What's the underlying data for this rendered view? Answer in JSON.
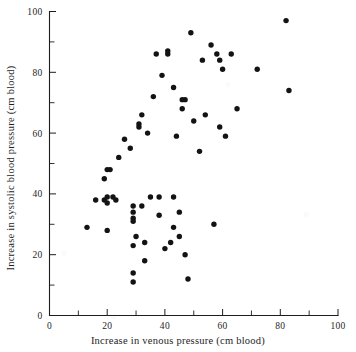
{
  "figure": {
    "background_color": "#ffffff",
    "ink_color": "#131313"
  },
  "chart_data": {
    "type": "scatter",
    "title": "",
    "subtitle": "",
    "xlabel": "Increase in venous pressure (cm blood)",
    "ylabel": "Increase in systolic blood pressure (cm blood)",
    "xlim": [
      0,
      100
    ],
    "ylim": [
      0,
      100
    ],
    "xticks": [
      0,
      20,
      40,
      60,
      80,
      100
    ],
    "yticks": [
      0,
      20,
      40,
      60,
      80,
      100
    ],
    "xticklabels": [
      "0",
      "20",
      "40",
      "60",
      "80",
      "100"
    ],
    "yticklabels": [
      "0",
      "20",
      "40",
      "60",
      "80",
      "100"
    ],
    "x_minor_tick_interval": 10,
    "y_minor_tick_interval": 10,
    "grid": false,
    "legend": null,
    "marker": "filled-circle",
    "marker_color": "#131313",
    "series": [
      {
        "name": "observations",
        "points": [
          [
            13,
            29
          ],
          [
            16,
            38
          ],
          [
            19,
            45
          ],
          [
            19,
            38
          ],
          [
            20,
            39
          ],
          [
            20,
            37
          ],
          [
            20,
            28
          ],
          [
            22,
            39
          ],
          [
            23,
            38
          ],
          [
            20,
            48
          ],
          [
            21,
            48
          ],
          [
            24,
            52
          ],
          [
            26,
            58
          ],
          [
            28,
            55
          ],
          [
            29,
            23
          ],
          [
            29,
            36
          ],
          [
            29,
            34
          ],
          [
            29,
            32
          ],
          [
            29,
            31
          ],
          [
            29,
            14
          ],
          [
            29,
            11
          ],
          [
            30,
            26
          ],
          [
            31,
            62
          ],
          [
            31,
            63
          ],
          [
            32,
            66
          ],
          [
            32,
            36
          ],
          [
            33,
            24
          ],
          [
            33,
            18
          ],
          [
            34,
            60
          ],
          [
            35,
            39
          ],
          [
            36,
            72
          ],
          [
            37,
            86
          ],
          [
            38,
            39
          ],
          [
            38,
            33
          ],
          [
            39,
            79
          ],
          [
            40,
            22
          ],
          [
            41,
            87
          ],
          [
            41,
            86
          ],
          [
            42,
            24
          ],
          [
            43,
            75
          ],
          [
            43,
            39
          ],
          [
            43,
            29
          ],
          [
            44,
            59
          ],
          [
            45,
            34
          ],
          [
            45,
            26
          ],
          [
            46,
            71
          ],
          [
            46,
            68
          ],
          [
            47,
            71
          ],
          [
            47,
            20
          ],
          [
            48,
            12
          ],
          [
            49,
            93
          ],
          [
            50,
            64
          ],
          [
            52,
            54
          ],
          [
            53,
            84
          ],
          [
            54,
            66
          ],
          [
            56,
            89
          ],
          [
            57,
            30
          ],
          [
            58,
            86
          ],
          [
            59,
            62
          ],
          [
            59,
            84
          ],
          [
            60,
            81
          ],
          [
            61,
            59
          ],
          [
            63,
            86
          ],
          [
            65,
            68
          ],
          [
            72,
            81
          ],
          [
            82,
            97
          ],
          [
            83,
            74
          ]
        ]
      }
    ]
  }
}
